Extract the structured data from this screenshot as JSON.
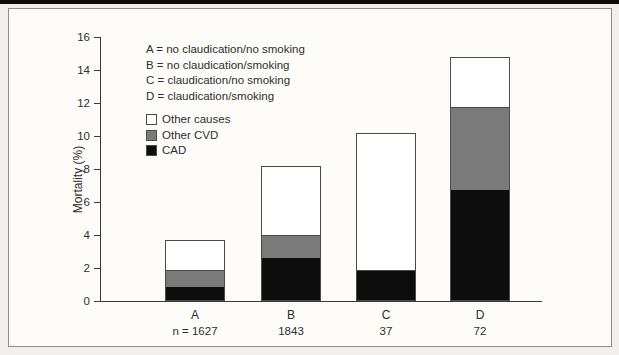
{
  "colors": {
    "background": "#f1efeb",
    "panel_bg": "#fdfcf9",
    "panel_border": "#8f8d86",
    "top_band": "#0c0c0c",
    "cad_black": "#0d0d0d",
    "other_cvd_gray": "#7a7a7a",
    "other_causes_white": "#ffffff",
    "outline": "#4a4a4a"
  },
  "definitions": [
    "A = no claudication/no smoking",
    "B = no claudication/smoking",
    "C = claudication/no smoking",
    "D = claudication/smoking"
  ],
  "legend": [
    {
      "label": "Other causes",
      "color_key": "other_causes_white"
    },
    {
      "label": "Other CVD",
      "color_key": "other_cvd_gray"
    },
    {
      "label": "CAD",
      "color_key": "cad_black"
    }
  ],
  "chart_data": {
    "type": "bar",
    "stacked": true,
    "title": "",
    "xlabel": "",
    "ylabel": "Mortality (%)",
    "ylim": [
      0,
      16
    ],
    "yticks": [
      0,
      2,
      4,
      6,
      8,
      10,
      12,
      14,
      16
    ],
    "grid": false,
    "legend_position": "upper-left",
    "categories": [
      "A",
      "B",
      "C",
      "D"
    ],
    "n_labels": [
      "n = 1627",
      "1843",
      "37",
      "72"
    ],
    "series": [
      {
        "name": "CAD",
        "color_key": "cad_black",
        "values": [
          0.9,
          2.7,
          1.9,
          6.8
        ]
      },
      {
        "name": "Other CVD",
        "color_key": "other_cvd_gray",
        "values": [
          1.0,
          1.3,
          0,
          5.0
        ]
      },
      {
        "name": "Other causes",
        "color_key": "other_causes_white",
        "values": [
          1.8,
          4.2,
          8.3,
          3.0
        ]
      }
    ],
    "stack_totals": [
      3.7,
      8.2,
      10.2,
      14.8
    ]
  }
}
